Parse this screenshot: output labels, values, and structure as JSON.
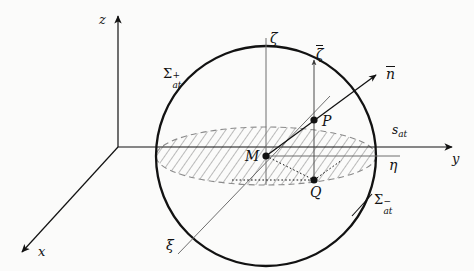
{
  "figure": {
    "type": "geometry-diagram",
    "background_color": "#fbfbfa",
    "ink_color": "#121212",
    "thin_line_color": "#555555"
  },
  "axes": {
    "global": [
      {
        "name": "z-axis",
        "label": "z",
        "direction": "up"
      },
      {
        "name": "y-axis",
        "label": "y",
        "direction": "right"
      },
      {
        "name": "x-axis",
        "label": "x",
        "direction": "down-left"
      }
    ],
    "local": [
      {
        "name": "zeta-axis",
        "label": "ζ",
        "direction": "up"
      },
      {
        "name": "eta-axis",
        "label": "η",
        "direction": "right"
      },
      {
        "name": "xi-axis",
        "label": "ξ",
        "direction": "down-left"
      }
    ]
  },
  "vectors": [
    {
      "name": "normal-vector",
      "label": "n",
      "overline": true,
      "direction": "up-right",
      "anchor_point": "P"
    },
    {
      "name": "local-vertical-vector",
      "label": "ζ",
      "overline": true,
      "direction": "up",
      "anchor_point": "P"
    }
  ],
  "points": [
    {
      "name": "point-M",
      "label": "M",
      "role": "sphere-center"
    },
    {
      "name": "point-P",
      "label": "P",
      "role": "surface-point"
    },
    {
      "name": "point-Q",
      "label": "Q",
      "role": "projected-point"
    }
  ],
  "surfaces": {
    "upper": {
      "symbol": "Σ",
      "superscript": "+",
      "subscript": "at",
      "text": "Σ⁺ₐₜ"
    },
    "lower": {
      "symbol": "Σ",
      "superscript": "−",
      "subscript": "at",
      "text": "Σ⁻ₐₜ"
    },
    "trace": {
      "symbol": "s",
      "subscript": "at",
      "text": "sₐₜ"
    }
  },
  "labels": {
    "z": "z",
    "y": "y",
    "x": "x",
    "zeta": "ζ",
    "eta": "η",
    "xi": "ξ",
    "zeta_bar": "ζ",
    "n_bar": "n",
    "M": "M",
    "P": "P",
    "Q": "Q",
    "sigma_letter": "Σ",
    "sigma_plus": "+",
    "sigma_minus": "−",
    "sigma_sub": "at",
    "s_letter": "s",
    "s_sub": "at"
  },
  "geometry": {
    "sphere": {
      "center_x": 266,
      "center_y": 156,
      "radius": 110
    },
    "disc": {
      "center_x": 266,
      "center_y": 156,
      "rx": 110,
      "ry": 29
    },
    "origin": {
      "x": 118,
      "y": 147
    },
    "point_M": {
      "x": 266,
      "y": 156
    },
    "point_P": {
      "x": 314,
      "y": 120
    },
    "point_Q": {
      "x": 314,
      "y": 180
    }
  }
}
